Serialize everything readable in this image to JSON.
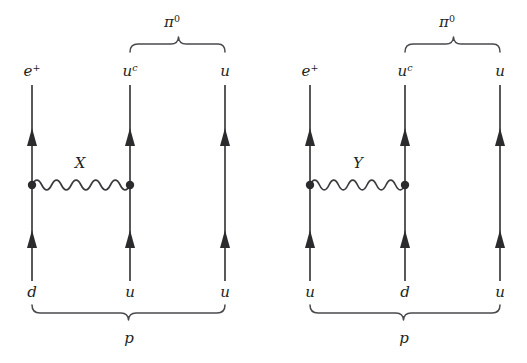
{
  "figure": {
    "background_color": "#ffffff",
    "line_color": "#3b3b3f",
    "text_color": "#231f20",
    "width": 527,
    "height": 363
  },
  "diagrams": [
    {
      "id": "left",
      "boson_label": "X",
      "boson_label_x": 80,
      "boson_label_y": 168,
      "upper_brace_label_base": "π",
      "upper_brace_label_sup": "0",
      "lower_brace_label": "p",
      "columns": [
        {
          "x": 32,
          "top_label_base": "e",
          "top_label_sup": "+",
          "bottom_label": "d"
        },
        {
          "x": 130,
          "top_label_base": "u",
          "top_label_sup": "c",
          "bottom_label": "u"
        },
        {
          "x": 225,
          "top_label_base": "u",
          "top_label_sup": "",
          "bottom_label": "u"
        }
      ]
    },
    {
      "id": "right",
      "boson_label": "Y",
      "boson_label_x": 358,
      "boson_label_y": 168,
      "upper_brace_label_base": "π",
      "upper_brace_label_sup": "0",
      "lower_brace_label": "p",
      "columns": [
        {
          "x": 310,
          "top_label_base": "e",
          "top_label_sup": "+",
          "bottom_label": "u"
        },
        {
          "x": 405,
          "top_label_base": "u",
          "top_label_sup": "c",
          "bottom_label": "d"
        },
        {
          "x": 500,
          "top_label_base": "u",
          "top_label_sup": "",
          "bottom_label": "u"
        }
      ]
    }
  ],
  "geometry": {
    "line_top_y": 85,
    "line_bottom_y": 281,
    "vertex_y": 185,
    "arrow_upper_y": 137,
    "arrow_lower_y": 239,
    "top_label_y": 75,
    "bottom_label_y": 296,
    "upper_brace_y": 48,
    "upper_brace_label_y": 25,
    "lower_brace_y": 309,
    "lower_brace_label_y": 342,
    "wave_cycles": 5,
    "wave_amplitude": 5,
    "vertex_dot_radius": 4
  }
}
